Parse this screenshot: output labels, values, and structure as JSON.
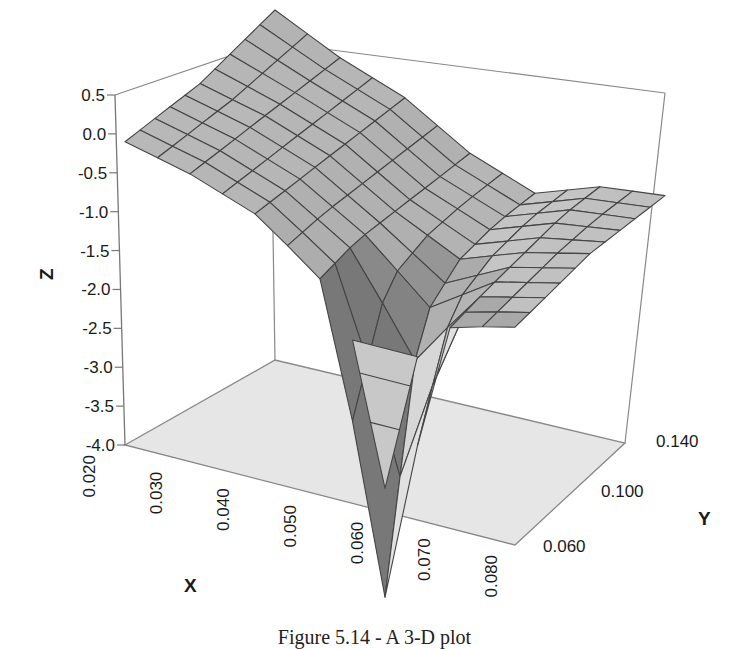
{
  "chart_data": {
    "type": "surface3d",
    "title": "",
    "caption": "Figure 5.14 - A 3-D plot",
    "xlabel": "X",
    "ylabel": "Y",
    "zlabel": "Z",
    "x_ticks": [
      "0.020",
      "0.030",
      "0.040",
      "0.050",
      "0.060",
      "0.070",
      "0.080"
    ],
    "y_ticks": [
      "0.060",
      "0.100",
      "0.140"
    ],
    "z_ticks": [
      "0.5",
      "0.0",
      "-0.5",
      "-1.0",
      "-1.5",
      "-2.0",
      "-2.5",
      "-3.0",
      "-3.5",
      "-4.0"
    ],
    "xlim": [
      0.02,
      0.08
    ],
    "ylim": [
      0.06,
      0.14
    ],
    "zlim": [
      -4.0,
      0.5
    ],
    "grid": false,
    "legend": null,
    "surface_notes": "Grey shaded mesh surface; high (~0.0 to 0.5) at low X, saddle through middle, sharp downward spike reaching approximately -3.7 near X=0.060, Y~0.060; right edge rises to about -0.6",
    "x": [
      0.02,
      0.03,
      0.04,
      0.05,
      0.06,
      0.07,
      0.08
    ],
    "y": [
      0.06,
      0.08,
      0.1,
      0.12,
      0.14
    ],
    "z": [
      [
        -0.1,
        -0.3,
        -0.6,
        -1.2,
        -3.7,
        -1.4,
        -1.2
      ],
      [
        0.0,
        -0.2,
        -0.5,
        -1.0,
        -1.8,
        -1.2,
        -1.0
      ],
      [
        0.1,
        -0.1,
        -0.4,
        -0.9,
        -1.3,
        -1.0,
        -0.8
      ],
      [
        0.3,
        0.0,
        -0.3,
        -0.8,
        -1.1,
        -0.8,
        -0.7
      ],
      [
        0.5,
        0.1,
        -0.2,
        -0.7,
        -1.0,
        -0.7,
        -0.6
      ]
    ]
  },
  "colors": {
    "surface_light": "#c4c4c4",
    "surface_mid": "#a8a8a8",
    "surface_dark": "#8c8c8c",
    "mesh_line": "#444444",
    "floor": "#e6e6e6",
    "box_line": "#777777",
    "text": "#1a1a1a"
  }
}
